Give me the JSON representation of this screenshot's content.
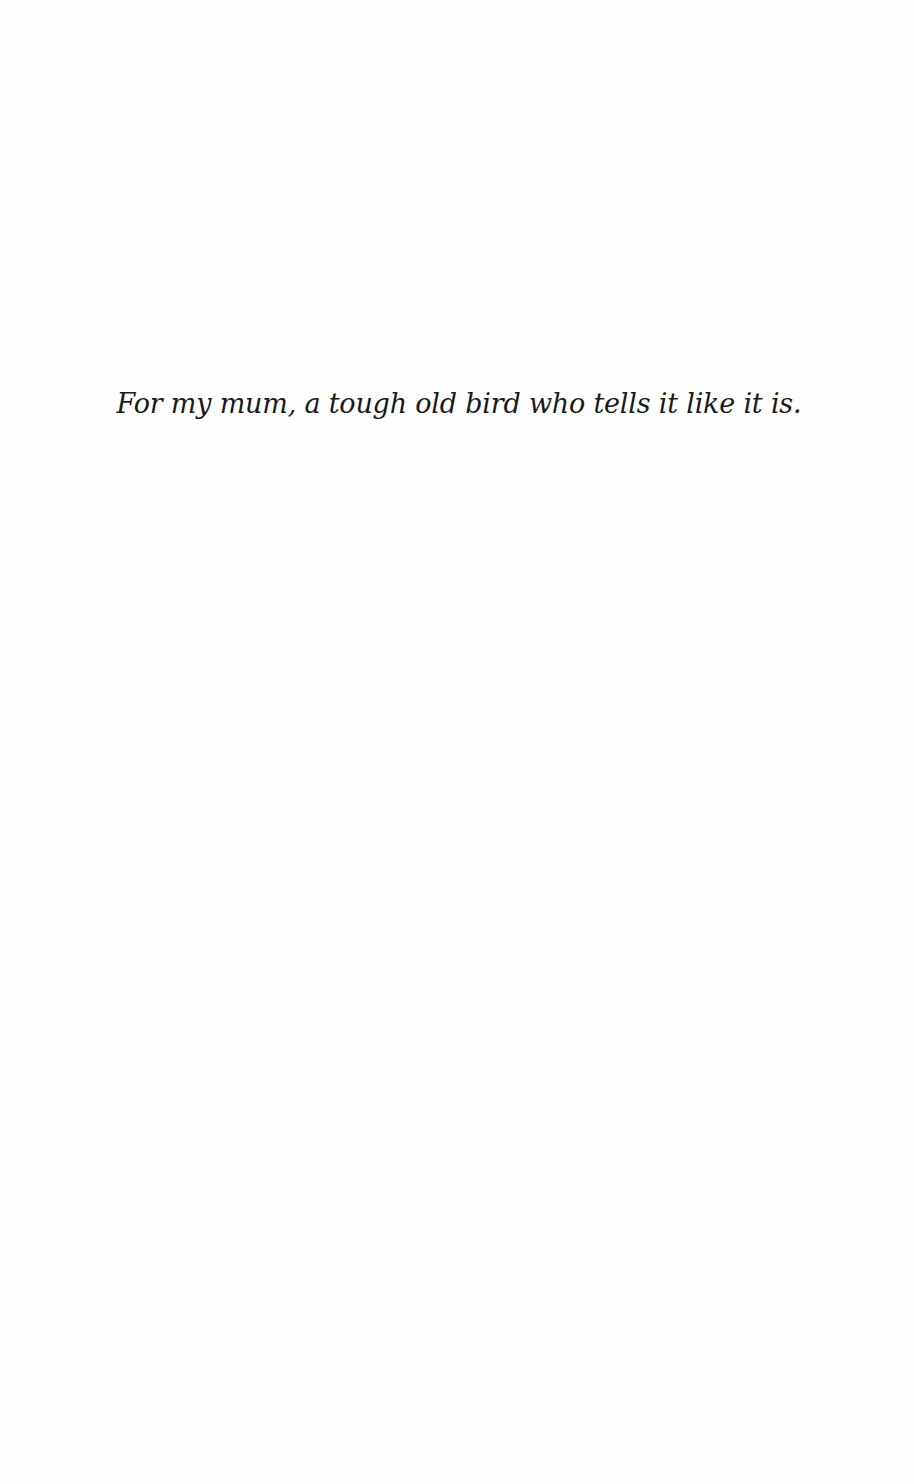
{
  "page": {
    "type": "dedication",
    "dedication_text": "For my mum, a tough old bird who tells it like it is."
  },
  "colors": {
    "background": "#fefefe",
    "text": "#1a1a1a"
  }
}
